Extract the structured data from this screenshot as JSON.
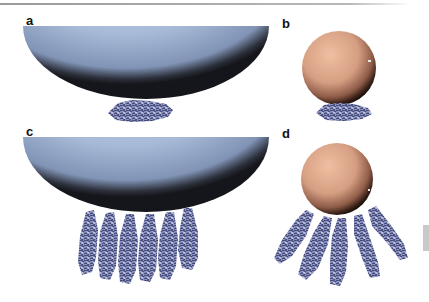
{
  "figure": {
    "panels": [
      {
        "id": "a",
        "label": "a",
        "description": "Large sphere (blue, half visible) with flat-lying protein cluster beneath"
      },
      {
        "id": "b",
        "label": "b",
        "description": "Small sphere (copper) with flat-lying protein cluster beneath"
      },
      {
        "id": "c",
        "label": "c",
        "description": "Large sphere (blue, half visible) with six upright protein bundles"
      },
      {
        "id": "d",
        "label": "d",
        "description": "Small sphere (copper) with five radially oriented protein bundles"
      }
    ],
    "colors": {
      "large_sphere": "#a9bcd8",
      "large_sphere_rim": "#1a1c22",
      "small_sphere": "#d9a58a",
      "small_sphere_rim": "#2a1812",
      "protein": "#7f86b4",
      "protein_dark": "#3f4575",
      "rule": "#a0a0a0"
    }
  }
}
